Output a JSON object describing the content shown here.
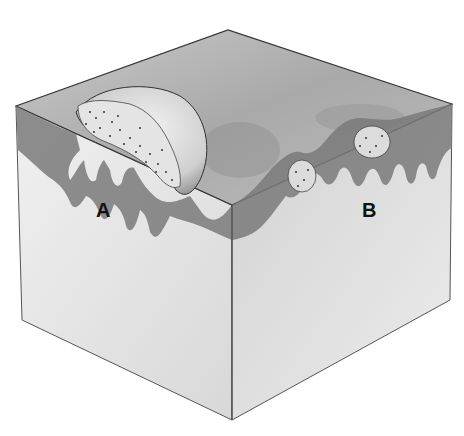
{
  "diagram": {
    "type": "block-diagram",
    "labels": [
      {
        "id": "A",
        "text": "A",
        "description": "large dome-shaped lesion on left face"
      },
      {
        "id": "B",
        "text": "B",
        "description": "small lesions within depressed surface on right face"
      }
    ],
    "colors": {
      "background": "#ffffff",
      "top_surface": "#b8b8b8",
      "dermis_band": "#7a7a7a",
      "side_face": "#e6e6e6",
      "outline": "#3a3a3a"
    }
  }
}
